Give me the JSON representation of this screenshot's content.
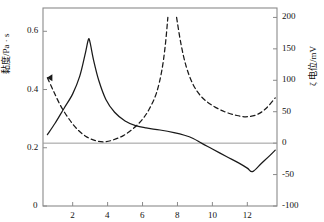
{
  "chart_data": {
    "type": "line",
    "title": "",
    "xlabel": "pH",
    "ylabel_left": "黏度/Pa · s",
    "ylabel_right": "ζ 电位/mV",
    "xlim": [
      0.3,
      13.7
    ],
    "xticks": [
      2,
      4,
      6,
      8,
      10,
      12
    ],
    "xticklabels": [
      "2",
      "4",
      "6",
      "8",
      "10",
      "12"
    ],
    "ylim_left": [
      0,
      0.68
    ],
    "yticks_left": [
      0,
      0.2,
      0.4,
      0.6
    ],
    "yticklabels_left": [
      "0",
      "0.2",
      "0.4",
      "0.6"
    ],
    "ylim_right": [
      -100,
      215
    ],
    "yticks_right": [
      -100,
      -50,
      0,
      50,
      100,
      150,
      200
    ],
    "yticklabels_right": [
      "-100",
      "-50",
      "0",
      "50",
      "100",
      "150",
      "200"
    ],
    "grid": false,
    "legend": "none",
    "series": [
      {
        "name": "黏度",
        "axis": "left",
        "style": "solid",
        "color": "#1a1a1a",
        "points": [
          [
            0.55,
            0.245
          ],
          [
            1.0,
            0.285
          ],
          [
            1.5,
            0.335
          ],
          [
            2.0,
            0.385
          ],
          [
            2.4,
            0.445
          ],
          [
            2.7,
            0.518
          ],
          [
            2.9,
            0.572
          ],
          [
            3.0,
            0.56
          ],
          [
            3.2,
            0.5
          ],
          [
            3.5,
            0.43
          ],
          [
            3.9,
            0.366
          ],
          [
            4.4,
            0.322
          ],
          [
            5.0,
            0.292
          ],
          [
            5.6,
            0.276
          ],
          [
            6.2,
            0.268
          ],
          [
            7.0,
            0.261
          ],
          [
            7.8,
            0.252
          ],
          [
            8.4,
            0.243
          ],
          [
            8.9,
            0.232
          ],
          [
            9.4,
            0.215
          ],
          [
            10.0,
            0.196
          ],
          [
            10.8,
            0.17
          ],
          [
            11.5,
            0.148
          ],
          [
            12.0,
            0.13
          ],
          [
            12.3,
            0.118
          ],
          [
            12.8,
            0.146
          ],
          [
            13.3,
            0.174
          ],
          [
            13.6,
            0.192
          ]
        ]
      },
      {
        "name": "ζ电位",
        "axis": "right",
        "style": "dashed",
        "color": "#1a1a1a",
        "segments": [
          [
            [
              0.55,
              104
            ],
            [
              0.9,
              83
            ],
            [
              1.3,
              60
            ],
            [
              1.8,
              38
            ],
            [
              2.3,
              21
            ],
            [
              2.8,
              10
            ],
            [
              3.3,
              4
            ],
            [
              3.8,
              2
            ],
            [
              4.3,
              5
            ],
            [
              4.9,
              12
            ],
            [
              5.5,
              24
            ],
            [
              6.0,
              38
            ],
            [
              6.4,
              55
            ],
            [
              6.8,
              80
            ],
            [
              7.1,
              115
            ],
            [
              7.3,
              155
            ],
            [
              7.45,
              200
            ]
          ],
          [
            [
              7.95,
              200
            ],
            [
              8.2,
              158
            ],
            [
              8.5,
              122
            ],
            [
              8.9,
              93
            ],
            [
              9.4,
              73
            ],
            [
              10.0,
              60
            ],
            [
              10.7,
              50
            ],
            [
              11.4,
              44
            ],
            [
              12.0,
              42
            ],
            [
              12.6,
              46
            ],
            [
              13.1,
              56
            ],
            [
              13.6,
              72
            ]
          ]
        ]
      }
    ],
    "annotations": [
      {
        "name": "left-edge-arrow",
        "x": 0.55,
        "y_right": 104
      }
    ]
  }
}
